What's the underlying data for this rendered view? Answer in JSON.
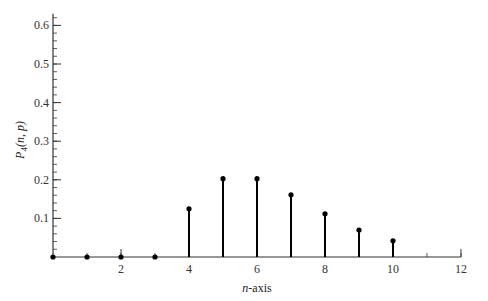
{
  "chart_data": {
    "type": "stem",
    "title": "",
    "xlabel": "n-axis",
    "ylabel": "P4(n, p)",
    "xlabel_parts": {
      "italic": "n",
      "rest": "-axis"
    },
    "ylabel_parts": {
      "main": "P",
      "sub": "4",
      "args": "(n, p)"
    },
    "x": [
      0,
      1,
      2,
      3,
      4,
      5,
      6,
      7,
      8,
      9,
      10
    ],
    "values": [
      0,
      0,
      0,
      0,
      0.125,
      0.203,
      0.203,
      0.161,
      0.112,
      0.07,
      0.042
    ],
    "xlim": [
      0,
      12
    ],
    "ylim": [
      0,
      0.63
    ],
    "x_ticks": [
      2,
      4,
      6,
      8,
      10,
      12
    ],
    "x_minor_step": 1,
    "y_ticks": [
      0.1,
      0.2,
      0.3,
      0.4,
      0.5,
      0.6
    ],
    "y_tick_labels": [
      "0.1",
      "0.2",
      "0.3",
      "0.4",
      "0.5",
      "0.6"
    ],
    "y_minor_step": 0.02,
    "grid": false,
    "legend": null,
    "colors": {
      "stem": "#000000",
      "axis": "#333333",
      "text": "#333333"
    }
  }
}
